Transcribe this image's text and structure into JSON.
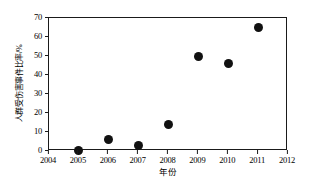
{
  "chart_data": {
    "type": "scatter",
    "title": "",
    "xlabel": "年份",
    "ylabel": "人群受伤害事件比率/%",
    "xlim": [
      2004,
      2012
    ],
    "ylim": [
      0,
      70
    ],
    "xticks": [
      2004,
      2005,
      2006,
      2007,
      2008,
      2009,
      2010,
      2011,
      2012
    ],
    "xtick_labels": [
      "2004",
      "2005",
      "2006",
      "2007",
      "2008",
      "2009",
      "2010",
      "2011",
      "2012"
    ],
    "yticks": [
      0,
      10,
      20,
      30,
      40,
      50,
      60,
      70
    ],
    "ytick_labels": [
      "0",
      "10",
      "20",
      "30",
      "40",
      "50",
      "60",
      "70"
    ],
    "grid": false,
    "legend": false,
    "marker": "filled-circle",
    "marker_color": "#111111",
    "frame_color": "#1a1a1a",
    "background": "#ffffff",
    "x": [
      2005,
      2006,
      2007,
      2008,
      2009,
      2010,
      2011
    ],
    "values": [
      0.5,
      6.3,
      3.0,
      14.2,
      50.0,
      46.0,
      65.0
    ],
    "points": [
      {
        "x": 2005,
        "y": 0.5
      },
      {
        "x": 2006,
        "y": 6.3
      },
      {
        "x": 2007,
        "y": 3.0
      },
      {
        "x": 2008,
        "y": 14.2
      },
      {
        "x": 2009,
        "y": 50.0
      },
      {
        "x": 2010,
        "y": 46.0
      },
      {
        "x": 2011,
        "y": 65.0
      }
    ]
  }
}
